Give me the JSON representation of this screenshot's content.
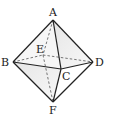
{
  "diagram": {
    "type": "octahedron",
    "vertices": {
      "A": {
        "label": "A",
        "x": 53,
        "y": 20
      },
      "B": {
        "label": "B",
        "x": 13,
        "y": 62
      },
      "C": {
        "label": "C",
        "x": 61,
        "y": 69
      },
      "D": {
        "label": "D",
        "x": 93,
        "y": 62
      },
      "E": {
        "label": "E",
        "x": 43,
        "y": 55
      },
      "F": {
        "label": "F",
        "x": 53,
        "y": 102
      }
    },
    "solid_edges": [
      "AB",
      "AD",
      "AC",
      "BC",
      "CD",
      "BF",
      "DF",
      "CF"
    ],
    "hidden_edges": [
      "AE",
      "BE",
      "ED",
      "EF"
    ],
    "shaded_faces": [
      "ACD",
      "BCF"
    ],
    "colors": {
      "line": "#222222",
      "shade": "#d8d8d8"
    }
  }
}
